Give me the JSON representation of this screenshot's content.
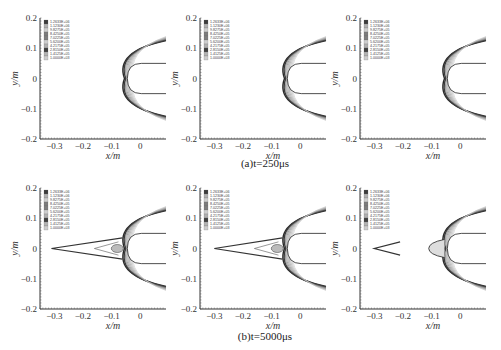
{
  "captions": {
    "row_a": "(a)t=250μs",
    "row_b": "(b)t=5000μs"
  },
  "axes": {
    "xlabel": "x/m",
    "ylabel": "y/m",
    "xticks": [
      "-0.3",
      "-0.2",
      "-0.1",
      "0"
    ],
    "yticks": [
      "0.2",
      "0.1",
      "0",
      "-0.1",
      "-0.2"
    ]
  },
  "legend": {
    "levels": [
      "1.2633E+06",
      "1.1230E+06",
      "9.8275E+05",
      "8.4250E+05",
      "7.0225E+05",
      "5.6200E+05",
      "4.2175E+05",
      "2.8150E+05",
      "1.4125E+05",
      "1.0000E+03"
    ]
  },
  "chart_data": [
    {
      "type": "heatmap",
      "title": "(a) t=250μs, panel 1",
      "xlabel": "x/m",
      "ylabel": "y/m",
      "xlim": [
        -0.35,
        0.09
      ],
      "ylim": [
        -0.2,
        0.2
      ],
      "bow_shock_nose_x": -0.055,
      "features": "bow shock only"
    },
    {
      "type": "heatmap",
      "title": "(a) t=250μs, panel 2",
      "xlabel": "x/m",
      "ylabel": "y/m",
      "xlim": [
        -0.35,
        0.09
      ],
      "ylim": [
        -0.2,
        0.2
      ],
      "bow_shock_nose_x": -0.055,
      "features": "bow shock only"
    },
    {
      "type": "heatmap",
      "title": "(a) t=250μs, panel 3",
      "xlabel": "x/m",
      "ylabel": "y/m",
      "xlim": [
        -0.35,
        0.09
      ],
      "ylim": [
        -0.2,
        0.2
      ],
      "bow_shock_nose_x": -0.055,
      "features": "bow shock only"
    },
    {
      "type": "heatmap",
      "title": "(b) t=5000μs, panel 1",
      "xlabel": "x/m",
      "ylabel": "y/m",
      "xlim": [
        -0.35,
        0.09
      ],
      "ylim": [
        -0.2,
        0.2
      ],
      "bow_shock_nose_x": -0.055,
      "precursor_tip_x": -0.31,
      "features": "bow shock with long precursor wedge"
    },
    {
      "type": "heatmap",
      "title": "(b) t=5000μs, panel 2",
      "xlabel": "x/m",
      "ylabel": "y/m",
      "xlim": [
        -0.35,
        0.09
      ],
      "ylim": [
        -0.2,
        0.2
      ],
      "bow_shock_nose_x": -0.055,
      "precursor_tip_x": -0.3,
      "features": "bow shock with precursor wedge"
    },
    {
      "type": "heatmap",
      "title": "(b) t=5000μs, panel 3",
      "xlabel": "x/m",
      "ylabel": "y/m",
      "xlim": [
        -0.35,
        0.09
      ],
      "ylim": [
        -0.2,
        0.2
      ],
      "bow_shock_nose_x": -0.055,
      "precursor_tip_x": -0.3,
      "secondary_nose_x": -0.11,
      "features": "detached precursor wedge and forward shock structure"
    }
  ]
}
